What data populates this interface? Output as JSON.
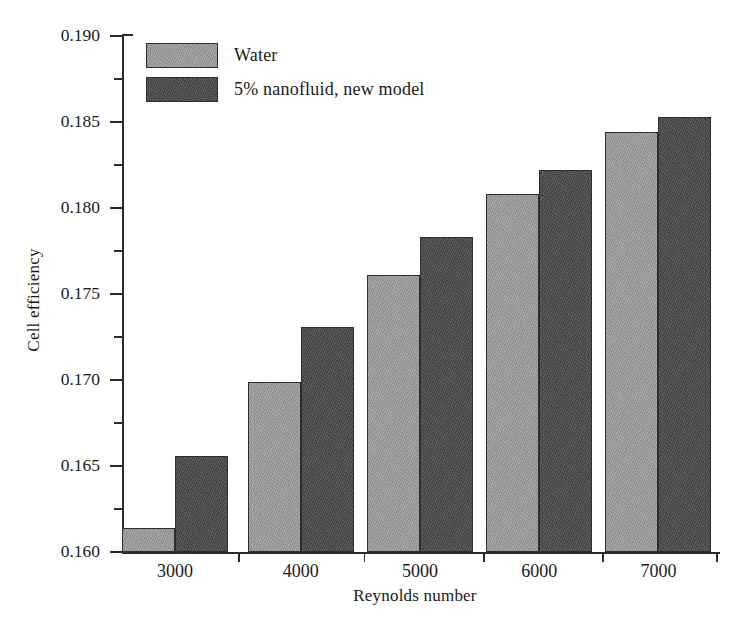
{
  "chart_data": {
    "type": "bar",
    "title": "",
    "xlabel": "Reynolds number",
    "ylabel": "Cell efficiency",
    "categories": [
      "3000",
      "4000",
      "5000",
      "6000",
      "7000"
    ],
    "series": [
      {
        "name": "Water",
        "color": "#9c9c9c",
        "values": [
          0.1614,
          0.1699,
          0.1761,
          0.1808,
          0.1844
        ]
      },
      {
        "name": "5% nanofluid, new model",
        "color": "#4b4b4b",
        "values": [
          0.1656,
          0.1731,
          0.1783,
          0.1822,
          0.1853
        ]
      }
    ],
    "ylim": [
      0.16,
      0.19
    ],
    "ytick_labels": [
      "0.160",
      "0.165",
      "0.170",
      "0.175",
      "0.180",
      "0.185",
      "0.190"
    ],
    "ytick_values": [
      0.16,
      0.165,
      0.17,
      0.175,
      0.18,
      0.185,
      0.19
    ],
    "yminor_values": [
      0.1625,
      0.1675,
      0.1725,
      0.1775,
      0.1825,
      0.1875
    ],
    "xlim": [
      0,
      5
    ],
    "grid": false,
    "legend_position": "upper-left-inside",
    "legend_entries": [
      "Water",
      "5% nanofluid, new model"
    ]
  },
  "axis": {
    "ylabel": "Cell efficiency",
    "xlabel": "Reynolds number"
  }
}
